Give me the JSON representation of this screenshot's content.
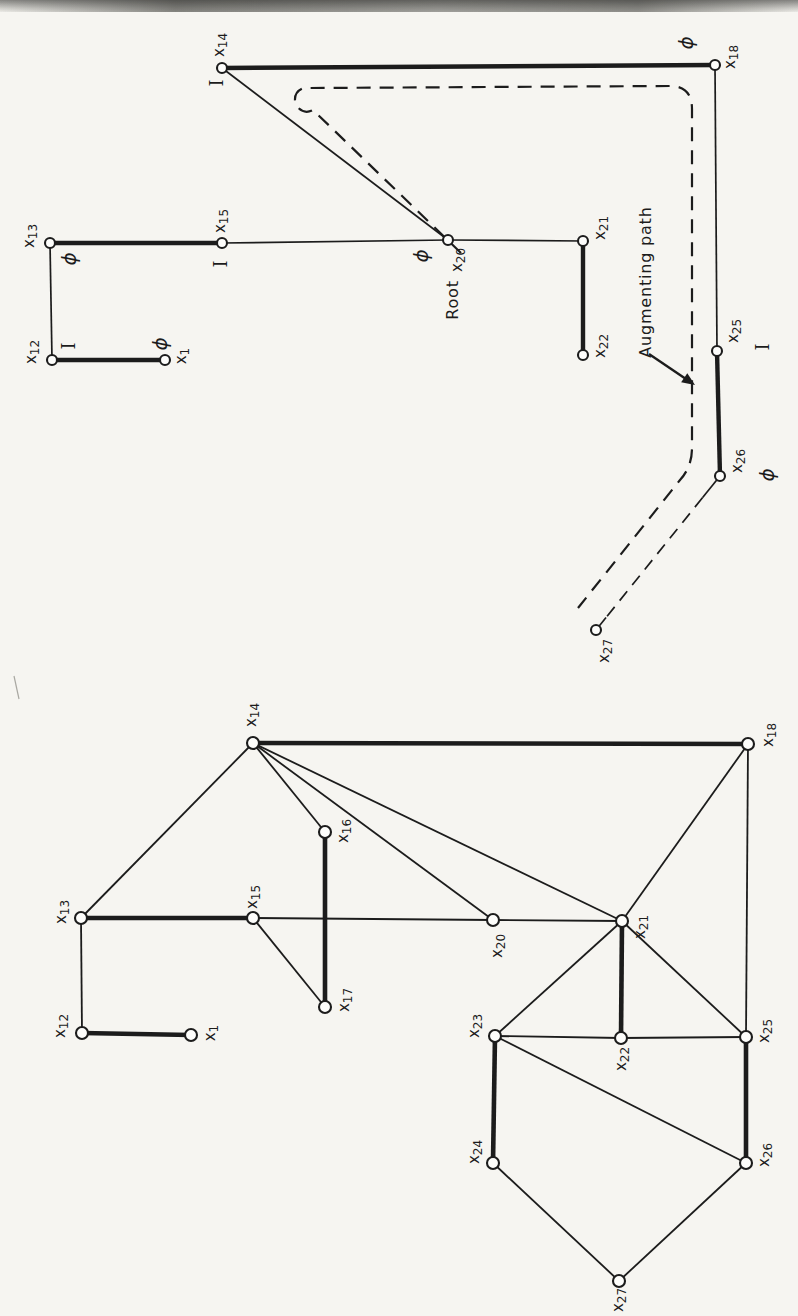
{
  "paper_color": "#f6f5f1",
  "ink_color": "#1c1c1c",
  "figures": {
    "tree": {
      "name": "alternating-tree-with-augmenting-path",
      "node_radius": 5,
      "stroke_heavy": 4.4,
      "stroke_thin": 1.7,
      "nodes": [
        {
          "id": "x14",
          "base": "x",
          "sub": "14",
          "x": 222,
          "y": 68,
          "lx": 219,
          "ly": 45,
          "tag": "I",
          "tx": 216,
          "ty": 83
        },
        {
          "id": "x18",
          "base": "x",
          "sub": "18",
          "x": 715,
          "y": 65,
          "lx": 730,
          "ly": 57,
          "tag": "ϕ",
          "tx": 686,
          "ty": 43
        },
        {
          "id": "x13",
          "base": "x",
          "sub": "13",
          "x": 50,
          "y": 243,
          "lx": 29,
          "ly": 236,
          "tag": "ϕ",
          "tx": 69,
          "ty": 259
        },
        {
          "id": "x15",
          "base": "x",
          "sub": "15",
          "x": 222,
          "y": 243,
          "lx": 220,
          "ly": 221,
          "tag": "I",
          "tx": 220,
          "ty": 264
        },
        {
          "id": "x20",
          "base": "x",
          "sub": "20",
          "x": 448,
          "y": 240,
          "lx": 457,
          "ly": 260,
          "tag": "ϕ",
          "tx": 421,
          "ty": 256
        },
        {
          "id": "x21",
          "base": "x",
          "sub": "21",
          "x": 583,
          "y": 241,
          "lx": 600,
          "ly": 228
        },
        {
          "id": "x22",
          "base": "x",
          "sub": "22",
          "x": 583,
          "y": 355,
          "lx": 600,
          "ly": 346
        },
        {
          "id": "x12",
          "base": "x",
          "sub": "12",
          "x": 52,
          "y": 360,
          "lx": 31,
          "ly": 352,
          "tag": "I",
          "tx": 68,
          "ty": 346
        },
        {
          "id": "x1",
          "base": "x",
          "sub": "1",
          "x": 165,
          "y": 360,
          "lx": 181,
          "ly": 356,
          "tag": "ϕ",
          "tx": 160,
          "ty": 344
        },
        {
          "id": "x25",
          "base": "x",
          "sub": "25",
          "x": 717,
          "y": 351,
          "lx": 733,
          "ly": 331,
          "tag": "I",
          "tx": 762,
          "ty": 347
        },
        {
          "id": "x26",
          "base": "x",
          "sub": "26",
          "x": 720,
          "y": 476,
          "lx": 737,
          "ly": 461,
          "tag": "ϕ",
          "tx": 767,
          "ty": 475
        },
        {
          "id": "x27",
          "base": "x",
          "sub": "27",
          "x": 596,
          "y": 630,
          "lx": 604,
          "ly": 651
        }
      ],
      "edges": [
        [
          "x13",
          "x15",
          "m"
        ],
        [
          "x12",
          "x1",
          "m"
        ],
        [
          "x14",
          "x18",
          "m"
        ],
        [
          "x21",
          "x22",
          "m"
        ],
        [
          "x25",
          "x26",
          "m"
        ],
        [
          "x13",
          "x12",
          "t"
        ],
        [
          "x15",
          "x20",
          "t"
        ],
        [
          "x20",
          "x14",
          "t"
        ],
        [
          "x20",
          "x21",
          "t"
        ],
        [
          "x18",
          "x25",
          "t"
        ],
        [
          "x26",
          "x27",
          "d"
        ]
      ],
      "dashed_outline": "M 461 253 L 313 110 A 12 12 0 1 1 310 88 L 670 86 Q 692 86 692 109 L 692 448 Q 692 467 680 480 L 578 608",
      "annotations": [
        {
          "id": "root-label",
          "text": "Root",
          "x": 452,
          "y": 300
        },
        {
          "id": "augmenting-path-label",
          "text": "Augmenting path",
          "x": 645,
          "y": 282
        }
      ],
      "arrow": {
        "x1": 649,
        "y1": 354,
        "x2": 695,
        "y2": 385
      }
    },
    "graph": {
      "name": "graph-with-matching",
      "node_radius": 6,
      "stroke_heavy": 4.6,
      "stroke_thin": 1.8,
      "nodes": [
        {
          "id": "x14",
          "base": "x",
          "sub": "14",
          "x": 253,
          "y": 743,
          "lx": 251,
          "ly": 715
        },
        {
          "id": "x18",
          "base": "x",
          "sub": "18",
          "x": 748,
          "y": 744,
          "lx": 768,
          "ly": 735
        },
        {
          "id": "x16",
          "base": "x",
          "sub": "16",
          "x": 325,
          "y": 832,
          "lx": 343,
          "ly": 831
        },
        {
          "id": "x13",
          "base": "x",
          "sub": "13",
          "x": 81,
          "y": 918,
          "lx": 61,
          "ly": 912
        },
        {
          "id": "x15",
          "base": "x",
          "sub": "15",
          "x": 253,
          "y": 918,
          "lx": 252,
          "ly": 897
        },
        {
          "id": "x20",
          "base": "x",
          "sub": "20",
          "x": 493,
          "y": 920,
          "lx": 497,
          "ly": 946
        },
        {
          "id": "x21",
          "base": "x",
          "sub": "21",
          "x": 622,
          "y": 921,
          "lx": 640,
          "ly": 927
        },
        {
          "id": "x17",
          "base": "x",
          "sub": "17",
          "x": 325,
          "y": 1007,
          "lx": 344,
          "ly": 1000
        },
        {
          "id": "x12",
          "base": "x",
          "sub": "12",
          "x": 82,
          "y": 1033,
          "lx": 60,
          "ly": 1026
        },
        {
          "id": "x1",
          "base": "x",
          "sub": "1",
          "x": 191,
          "y": 1035,
          "lx": 210,
          "ly": 1033
        },
        {
          "id": "x23",
          "base": "x",
          "sub": "23",
          "x": 495,
          "y": 1036,
          "lx": 474,
          "ly": 1026
        },
        {
          "id": "x22",
          "base": "x",
          "sub": "22",
          "x": 621,
          "y": 1038,
          "lx": 621,
          "ly": 1059
        },
        {
          "id": "x25",
          "base": "x",
          "sub": "25",
          "x": 746,
          "y": 1037,
          "lx": 764,
          "ly": 1031
        },
        {
          "id": "x24",
          "base": "x",
          "sub": "24",
          "x": 493,
          "y": 1163,
          "lx": 474,
          "ly": 1152
        },
        {
          "id": "x26",
          "base": "x",
          "sub": "26",
          "x": 746,
          "y": 1163,
          "lx": 764,
          "ly": 1155
        },
        {
          "id": "x27",
          "base": "x",
          "sub": "27",
          "x": 619,
          "y": 1281,
          "lx": 618,
          "ly": 1300
        }
      ],
      "edges": [
        [
          "x12",
          "x1",
          "m"
        ],
        [
          "x13",
          "x15",
          "m"
        ],
        [
          "x16",
          "x17",
          "m"
        ],
        [
          "x14",
          "x18",
          "m"
        ],
        [
          "x21",
          "x22",
          "m"
        ],
        [
          "x23",
          "x24",
          "m"
        ],
        [
          "x25",
          "x26",
          "m"
        ],
        [
          "x13",
          "x12",
          "t"
        ],
        [
          "x13",
          "x14",
          "t"
        ],
        [
          "x14",
          "x16",
          "t"
        ],
        [
          "x14",
          "x20",
          "t"
        ],
        [
          "x14",
          "x21",
          "t"
        ],
        [
          "x15",
          "x20",
          "t"
        ],
        [
          "x20",
          "x21",
          "t"
        ],
        [
          "x15",
          "x17",
          "t"
        ],
        [
          "x18",
          "x21",
          "t"
        ],
        [
          "x18",
          "x25",
          "t"
        ],
        [
          "x21",
          "x23",
          "t"
        ],
        [
          "x21",
          "x25",
          "t"
        ],
        [
          "x22",
          "x23",
          "t"
        ],
        [
          "x22",
          "x25",
          "t"
        ],
        [
          "x23",
          "x26",
          "t"
        ],
        [
          "x24",
          "x27",
          "t"
        ],
        [
          "x26",
          "x27",
          "t"
        ]
      ]
    }
  }
}
